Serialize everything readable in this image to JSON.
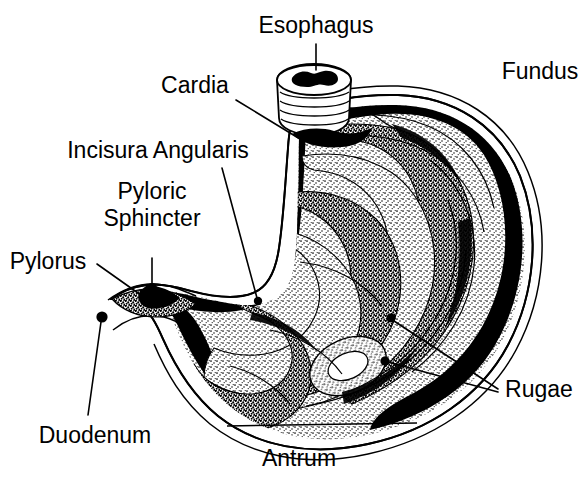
{
  "diagram": {
    "style": "black-and-white stipple line drawing",
    "colors": {
      "background": "#ffffff",
      "ink": "#000000"
    },
    "labels": [
      {
        "id": "esophagus",
        "text": "Esophagus",
        "text_x": 316,
        "text_y": 33,
        "anchor": "middle",
        "leader": {
          "type": "line",
          "points": "316,44 316,70"
        },
        "dot": null
      },
      {
        "id": "fundus",
        "text": "Fundus",
        "text_x": 540,
        "text_y": 79,
        "anchor": "middle",
        "leader": null,
        "dot": null
      },
      {
        "id": "cardia",
        "text": "Cardia",
        "text_x": 195,
        "text_y": 93,
        "anchor": "middle",
        "leader": {
          "type": "line",
          "points": "236,100 300,139"
        },
        "dot": null
      },
      {
        "id": "incisura-angularis",
        "text": "Incisura Angularis",
        "text_x": 158,
        "text_y": 158,
        "anchor": "middle",
        "leader": {
          "type": "line",
          "points": "222,168 258,300"
        },
        "dot": {
          "x": 258,
          "y": 301,
          "r": 4.2
        }
      },
      {
        "id": "pyloric-sphincter",
        "text": "Pyloric\nSphincter",
        "text_line_1": "Pyloric",
        "text_line_2": "Sphincter",
        "text_x": 152,
        "text_y": 203,
        "anchor": "middle",
        "leader": {
          "type": "line",
          "points": "152,258 152,285"
        },
        "dot": {
          "x": 152,
          "y": 288,
          "r": 5.0
        }
      },
      {
        "id": "pylorus",
        "text": "Pylorus",
        "text_x": 48,
        "text_y": 269,
        "anchor": "middle",
        "leader": {
          "type": "line",
          "points": "97,264 145,298"
        },
        "dot": {
          "x": 147,
          "y": 300,
          "r": 5.0
        }
      },
      {
        "id": "duodenum",
        "text": "Duodenum",
        "text_x": 95,
        "text_y": 443,
        "anchor": "middle",
        "leader": {
          "type": "line",
          "points": "101,322 88,415"
        },
        "dot": {
          "x": 102,
          "y": 317,
          "r": 5.6
        }
      },
      {
        "id": "antrum",
        "text": "Antrum",
        "text_x": 299,
        "text_y": 466,
        "anchor": "middle",
        "leader": {
          "type": "bracket",
          "points": "227,425 417,423"
        },
        "dot": null
      },
      {
        "id": "rugae",
        "text": "Rugae",
        "text_x": 539,
        "text_y": 397,
        "anchor": "middle",
        "leader": {
          "type": "double-line",
          "points_a": "498,389 393,320",
          "points_b": "498,392 387,362"
        },
        "dot_a": {
          "x": 391,
          "y": 318,
          "r": 4.6
        },
        "dot_b": {
          "x": 385,
          "y": 361,
          "r": 4.6
        }
      }
    ],
    "structures": [
      {
        "id": "stomach-body",
        "name": "stomach body and fundus"
      },
      {
        "id": "esophagus-tube",
        "name": "esophageal tube with circular ring folds"
      },
      {
        "id": "rugae-folds",
        "name": "longitudinal mucosal folds (rugae)"
      },
      {
        "id": "pyloric-canal",
        "name": "pyloric canal and sphincter"
      },
      {
        "id": "duodenal-bulb",
        "name": "proximal duodenum"
      }
    ]
  }
}
